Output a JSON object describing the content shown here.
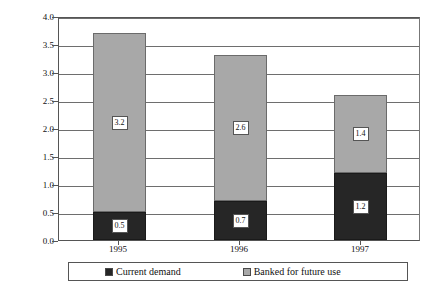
{
  "chart_data": {
    "type": "bar",
    "subtype": "stacked-vertical",
    "title": "",
    "xlabel": "",
    "ylabel": "Millions of allowances",
    "categories": [
      "1995",
      "1996",
      "1997"
    ],
    "series": [
      {
        "name": "Current demand",
        "color": "#262626",
        "values": [
          0.5,
          0.7,
          1.2
        ],
        "labels": [
          "0.5",
          "0.7",
          "1.2"
        ]
      },
      {
        "name": "Banked for future use",
        "color": "#a8a8a8",
        "values": [
          3.2,
          2.6,
          1.4
        ],
        "labels": [
          "3.2",
          "2.6",
          "1.4"
        ]
      }
    ],
    "totals": [
      3.7,
      3.3,
      2.6
    ],
    "ylim": [
      0.0,
      4.0
    ],
    "ytick_step": 0.5,
    "yticks": [
      "4.0",
      "3.5",
      "3.0",
      "2.5",
      "2.0",
      "1.5",
      "1.0",
      "0.5",
      "0.0"
    ],
    "ytick_values": [
      4.0,
      3.5,
      3.0,
      2.5,
      2.0,
      1.5,
      1.0,
      0.5,
      0.0
    ],
    "grid": true,
    "grid_axis": "y",
    "legend_position": "bottom",
    "legend_entries": [
      "Current demand",
      "Banked for future use"
    ]
  }
}
